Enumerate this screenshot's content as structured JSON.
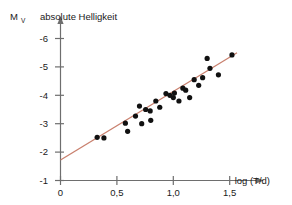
{
  "figure": {
    "axis_symbol": "M",
    "axis_symbol_sub": "V",
    "header_label": "absolute Helligkeit",
    "xlabel": "log (T/d)",
    "line_color": "#c9806e",
    "point_color": "#111111",
    "axis_color": "#6e6e6e"
  },
  "chart_data": {
    "type": "scatter",
    "title": "absolute Helligkeit",
    "xlabel": "log (T/d)",
    "ylabel": "M_V",
    "xlim": [
      0,
      1.72
    ],
    "ylim": [
      -1,
      -6.4
    ],
    "y_inverted": true,
    "grid": false,
    "legend": null,
    "xticks": [
      0,
      0.5,
      1.0,
      1.5
    ],
    "xticklabels": [
      "0",
      "0,5",
      "1,0",
      "1,5"
    ],
    "yticks": [
      -1,
      -2,
      -3,
      -4,
      -5,
      -6
    ],
    "yticklabels": [
      "-1",
      "-2",
      "-3",
      "-4",
      "-5",
      "-6"
    ],
    "points": [
      {
        "x": 0.325,
        "y": -2.52
      },
      {
        "x": 0.385,
        "y": -2.5
      },
      {
        "x": 0.575,
        "y": -3.02
      },
      {
        "x": 0.595,
        "y": -2.73
      },
      {
        "x": 0.665,
        "y": -3.27
      },
      {
        "x": 0.7,
        "y": -3.62
      },
      {
        "x": 0.72,
        "y": -3.0
      },
      {
        "x": 0.755,
        "y": -3.5
      },
      {
        "x": 0.795,
        "y": -3.45
      },
      {
        "x": 0.8,
        "y": -3.12
      },
      {
        "x": 0.845,
        "y": -3.8
      },
      {
        "x": 0.88,
        "y": -3.58
      },
      {
        "x": 0.935,
        "y": -4.06
      },
      {
        "x": 0.97,
        "y": -4.0
      },
      {
        "x": 1.0,
        "y": -3.92
      },
      {
        "x": 1.01,
        "y": -4.08
      },
      {
        "x": 1.05,
        "y": -3.8
      },
      {
        "x": 1.085,
        "y": -4.25
      },
      {
        "x": 1.11,
        "y": -4.18
      },
      {
        "x": 1.145,
        "y": -3.92
      },
      {
        "x": 1.185,
        "y": -4.55
      },
      {
        "x": 1.225,
        "y": -4.35
      },
      {
        "x": 1.26,
        "y": -4.62
      },
      {
        "x": 1.3,
        "y": -5.3
      },
      {
        "x": 1.325,
        "y": -4.95
      },
      {
        "x": 1.4,
        "y": -4.72
      },
      {
        "x": 1.52,
        "y": -5.42
      }
    ],
    "fit_line": {
      "x": [
        0.0,
        1.565
      ],
      "y": [
        -1.72,
        -5.5
      ],
      "color": "#c9806e"
    }
  }
}
